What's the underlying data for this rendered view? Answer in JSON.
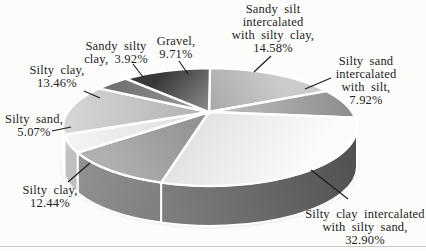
{
  "figure": {
    "kind": "scanned 3d grayscale pie chart figure",
    "background_color": "#fcfcfb",
    "rule_line_color": "#c9c9c9",
    "label_text_color": "#1c1c1c",
    "leader_line_color": "#1a1a1a"
  },
  "chart_data": {
    "type": "pie",
    "style": "3d-extruded-grayscale",
    "title": "",
    "legend": false,
    "start_angle_deg_clockwise_from_top": 0,
    "total": 100,
    "slices": [
      {
        "id": "sandy-silt-intercalated-with-silty-clay",
        "label": "Sandy silt intercalated with silty clay",
        "value": 14.58,
        "fill_inner": "#a8a8a8",
        "fill_outer": "#cbcbcb",
        "callout": {
          "lines": [
            "Sandy silt",
            "intercalated",
            "with silty clay,",
            "14.58%"
          ],
          "x": 273,
          "y": 3,
          "leader": [
            [
              271,
              56
            ],
            [
              254,
              72
            ]
          ]
        }
      },
      {
        "id": "silty-sand-intercalated-with-silt",
        "label": "Silty sand intercalated with silt",
        "value": 7.92,
        "fill_inner": "#c2c2c2",
        "fill_outer": "#8f8f8f",
        "callout": {
          "lines": [
            "Silty sand",
            "intercalated",
            "with silt,",
            "7.92%"
          ],
          "x": 366,
          "y": 55,
          "leader": [
            [
              331,
              78
            ],
            [
              305,
              89
            ]
          ]
        }
      },
      {
        "id": "silty-clay-intercalated-with-silty-sand",
        "label": "Silty clay intercalated with silty sand",
        "value": 32.9,
        "fill_inner": "#e3e3e3",
        "fill_outer": "#fbfbfb",
        "side": [
          "#4f4f4f",
          "#7e7e7e"
        ],
        "callout": {
          "lines": [
            "Silty clay intercalated",
            "with silty sand,",
            "32.90%"
          ],
          "x": 365,
          "y": 208,
          "leader": [
            [
              311,
              170
            ],
            [
              348,
              199
            ]
          ]
        }
      },
      {
        "id": "silty-clay-12-44",
        "label": "Silty clay",
        "value": 12.44,
        "fill_inner": "#8e8e8e",
        "fill_outer": "#b0b0b0",
        "side": [
          "#808080",
          "#929292"
        ],
        "callout": {
          "lines": [
            "Silty clay,",
            "12.44%"
          ],
          "x": 50,
          "y": 184,
          "leader": [
            [
              68,
              182
            ],
            [
              90,
              163
            ]
          ]
        }
      },
      {
        "id": "silty-sand-5-07",
        "label": "Silty sand",
        "value": 5.07,
        "fill_inner": "#dcdcdc",
        "fill_outer": "#f4f4f4",
        "side": [
          "#c0c0c0",
          "#cecece"
        ],
        "callout": {
          "lines": [
            "Silty sand,",
            "5.07%"
          ],
          "x": 34,
          "y": 113,
          "leader": [
            [
              52,
              131
            ],
            [
              71,
              127
            ]
          ]
        }
      },
      {
        "id": "silty-clay-13-46",
        "label": "Silty clay",
        "value": 13.46,
        "fill_inner": "#b0b0b0",
        "fill_outer": "#d6d6d6",
        "side": [
          "#b4b4b4",
          "#c0c0c0"
        ],
        "callout": {
          "lines": [
            "Silty clay,",
            "13.46%"
          ],
          "x": 57,
          "y": 64,
          "leader": [
            [
              84,
              91
            ],
            [
              100,
              98
            ]
          ]
        }
      },
      {
        "id": "sandy-silty-clay",
        "label": "Sandy silty clay",
        "value": 3.92,
        "fill_inner": "#9e9e9e",
        "fill_outer": "#6f6f6f",
        "callout": {
          "lines": [
            "Sandy silty",
            "clay, 3.92%"
          ],
          "x": 116,
          "y": 40,
          "leader": [
            [
              133,
              64
            ],
            [
              143,
              77
            ]
          ]
        }
      },
      {
        "id": "gravel",
        "label": "Gravel",
        "value": 9.71,
        "fill_inner": "#8c8c8c",
        "fill_outer": "#383838",
        "callout": {
          "lines": [
            "Gravel,",
            "9.71%"
          ],
          "x": 176,
          "y": 35,
          "leader": [
            [
              179,
              61
            ],
            [
              188,
              74
            ]
          ]
        }
      }
    ]
  }
}
